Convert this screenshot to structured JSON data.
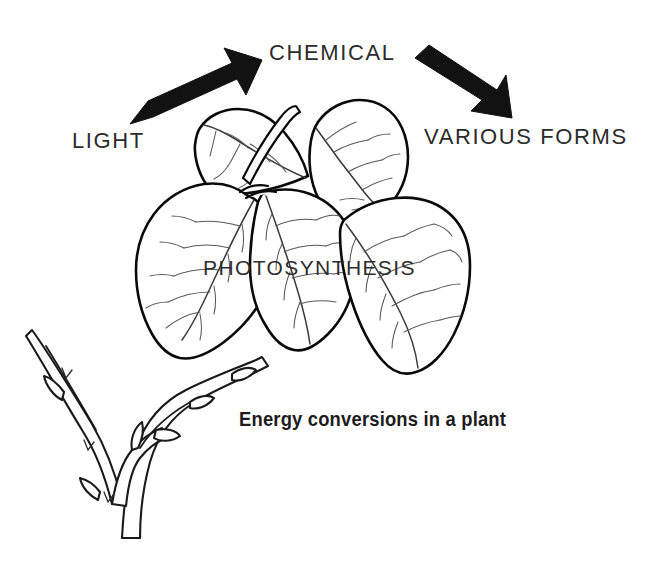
{
  "figure": {
    "title": "Energy conversions in a plant",
    "background_color": "#ffffff",
    "ink_color": "#0a0a0a",
    "caption": "Energy conversions in a plant",
    "labels": {
      "light": "LIGHT",
      "chemical": "CHEMICAL",
      "various_forms": "VARIOUS FORMS",
      "photosynthesis": "PHOTOSYNTHESIS"
    },
    "arrows": [
      {
        "name": "light-to-chemical-arrow",
        "direction": "up-right",
        "from_label": "LIGHT",
        "to_label": "CHEMICAL",
        "color": "#121212"
      },
      {
        "name": "chemical-to-various-forms-arrow",
        "direction": "down-right",
        "from_label": "CHEMICAL",
        "to_label": "VARIOUS FORMS",
        "color": "#121212"
      }
    ],
    "illustration": {
      "name": "leaf-cluster-on-branch",
      "leaf_count": 5,
      "branch": "woody twig with buds",
      "style": "black ink line drawing"
    }
  }
}
